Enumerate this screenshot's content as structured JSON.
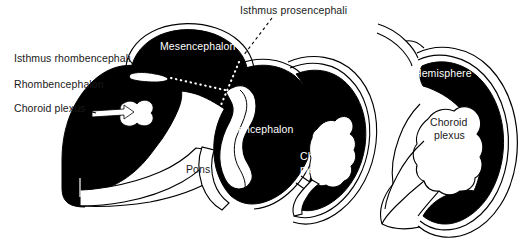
{
  "figure": {
    "background_color": "#ffffff",
    "ink_color": "#000000",
    "label_text_color": "#1a1a1a",
    "reversed_text_color": "#ffffff",
    "width": 529,
    "height": 238
  },
  "labels": {
    "isthmus_prosencephali": "Isthmus prosencephali",
    "isthmus_rhombencephali": "Isthmus rhombencephali",
    "rhombencephalon": "Rhombencephalon",
    "choroid_plexus_left": "Choroid plexus",
    "mesencephalon": "Mesencephalon",
    "diencephalon": "Diencephalon",
    "pons": "Pons",
    "choroid_plexus_center_line1": "Choroid",
    "choroid_plexus_center_line2": "plexus",
    "hemisphere": "Hemisphere",
    "choroid_plexus_right_line1": "Choroid",
    "choroid_plexus_right_line2": "plexus"
  },
  "leader_lines": {
    "isthmus_prosencephali_style": "black-dashed",
    "isthmus_rhombencephali_style": "black-solid-short",
    "choroid_plexus_left_style": "black-solid-arrow",
    "mesencephalon_to_ventricle_style": "white-dotted",
    "isthmus_prosencephali_to_ventricle_style": "white-dotted"
  },
  "structures": [
    {
      "name": "rhombencephalon-mass",
      "fill": "#000000"
    },
    {
      "name": "mesencephalon-vesicle",
      "fill": "#000000"
    },
    {
      "name": "diencephalon-vesicle",
      "fill": "#000000"
    },
    {
      "name": "telencephalic-vesicle",
      "fill": "#000000"
    },
    {
      "name": "hemisphere-vesicle",
      "fill": "#000000"
    },
    {
      "name": "choroid-plexus-cavity",
      "fill": "#ffffff"
    },
    {
      "name": "ventricular-cavity",
      "fill": "#ffffff"
    },
    {
      "name": "pons-cavity",
      "fill": "#ffffff"
    }
  ]
}
